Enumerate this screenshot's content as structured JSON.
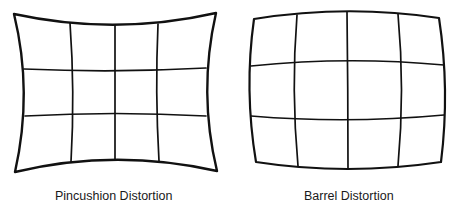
{
  "diagrams": [
    {
      "id": "pincushion",
      "caption": "Pincushion Distortion",
      "grid": {
        "columns": 4,
        "rows": 3
      },
      "stroke_color": "#111111"
    },
    {
      "id": "barrel",
      "caption": "Barrel Distortion",
      "grid": {
        "columns": 4,
        "rows": 3
      },
      "stroke_color": "#111111"
    }
  ]
}
